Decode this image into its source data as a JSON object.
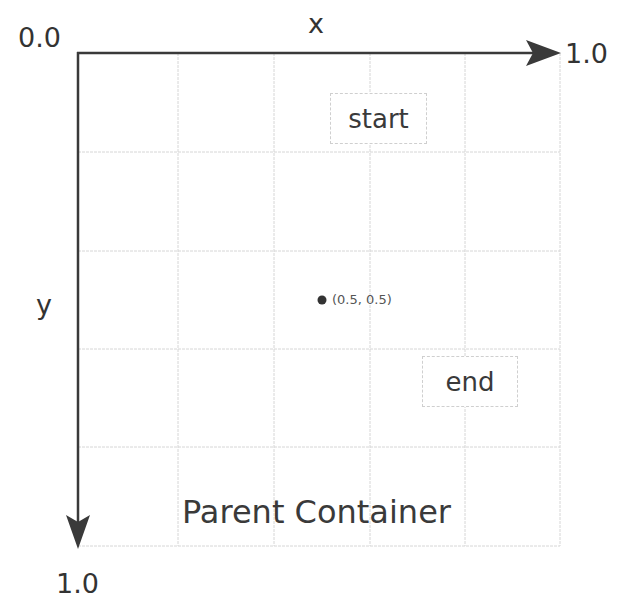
{
  "diagram": {
    "origin_label": "0.0",
    "x_axis": {
      "name": "x",
      "end_label": "1.0"
    },
    "y_axis": {
      "name": "y",
      "end_label": "1.0"
    },
    "grid": {
      "columns": 5,
      "rows": 5,
      "line_color": "#d6d6d6"
    },
    "boxes": [
      {
        "id": "start",
        "label": "start"
      },
      {
        "id": "end",
        "label": "end"
      }
    ],
    "center_point": {
      "label": "(0.5, 0.5)",
      "color": "#333333"
    },
    "container_label": "Parent Container",
    "colors": {
      "axis": "#3a3a3a",
      "text": "#3a3a3a",
      "box_border": "#cfcfcf"
    }
  }
}
